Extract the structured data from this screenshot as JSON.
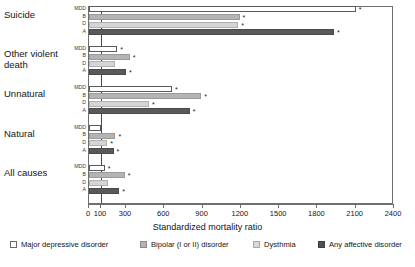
{
  "chart_data": {
    "type": "bar",
    "orientation": "horizontal",
    "title": "",
    "xlabel": "Standardized mortality ratio",
    "ylabel": "",
    "xticks": [
      0,
      100,
      300,
      600,
      900,
      1200,
      1500,
      1800,
      2100,
      2400
    ],
    "xtick_labels": [
      "0",
      "100",
      "300",
      "600",
      "900",
      "1200",
      "1500",
      "1800",
      "2100",
      "2400"
    ],
    "xlim": [
      0,
      2400
    ],
    "reference_line": 100,
    "grid": false,
    "legend_position": "bottom",
    "note": "Axis is compressed between 0 and 300; asterisk marks statistically significant values",
    "categories": [
      "Suicide",
      "Other violent death",
      "Unnatural",
      "Natural",
      "All causes"
    ],
    "series": [
      {
        "name": "Major depressive disorder",
        "code": "MDD",
        "color": "#ffffff",
        "values": [
          2100,
          230,
          660,
          100,
          130
        ],
        "significant": [
          true,
          true,
          true,
          false,
          true
        ]
      },
      {
        "name": "Bipolar (I or II) disorder",
        "code": "B",
        "color": "#b4b4b4",
        "values": [
          1190,
          330,
          890,
          215,
          290
        ],
        "significant": [
          true,
          true,
          true,
          true,
          true
        ]
      },
      {
        "name": "Dysthmia",
        "code": "D",
        "color": "#d5d5d5",
        "values": [
          1180,
          215,
          480,
          150,
          155
        ],
        "significant": [
          true,
          false,
          true,
          true,
          false
        ]
      },
      {
        "name": "Any affective disorder",
        "code": "A",
        "color": "#595959",
        "values": [
          1930,
          300,
          800,
          200,
          245
        ],
        "significant": [
          true,
          true,
          true,
          true,
          true
        ]
      }
    ]
  },
  "axis": {
    "x_title": "Standardized mortality ratio",
    "sub_labels": [
      "MDD",
      "B",
      "D",
      "A"
    ]
  },
  "legend": {
    "items": [
      {
        "label": "Major depressive disorder",
        "swatch": "mdd-swatch"
      },
      {
        "label": "Bipolar (I or II) disorder",
        "swatch": "bipolar-swatch"
      },
      {
        "label": "Dysthmia",
        "swatch": "dysthmia-swatch"
      },
      {
        "label": "Any affective disorder",
        "swatch": "any-affective-swatch"
      }
    ]
  }
}
